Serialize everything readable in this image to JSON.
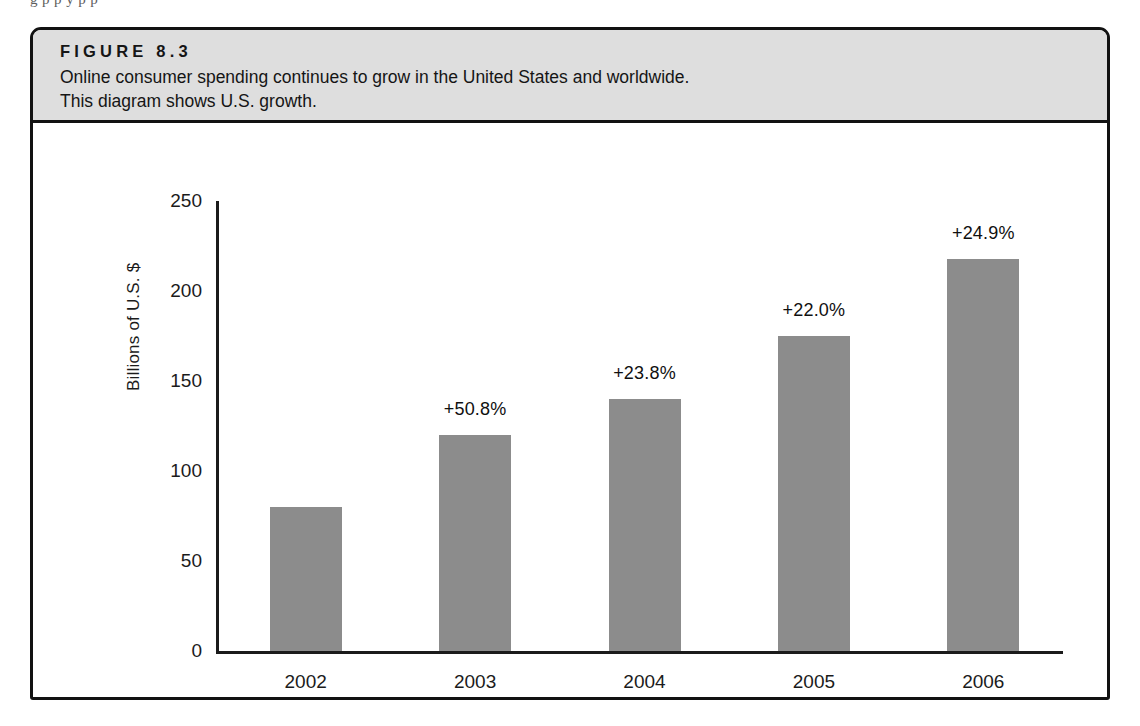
{
  "page": {
    "bleed_text_top": "g                p                    p      y            p                                    p"
  },
  "figure": {
    "label": "FIGURE 8.3",
    "description_line1": "Online consumer spending continues to grow in the United States and worldwide.",
    "description_line2": "This diagram shows U.S. growth.",
    "band_color": "#dedede",
    "border_color": "#121212"
  },
  "chart_data": {
    "type": "bar",
    "title": "",
    "xlabel": "",
    "ylabel": "Billions of U.S. $",
    "categories": [
      "2002",
      "2003",
      "2004",
      "2005",
      "2006"
    ],
    "values": [
      80,
      120,
      140,
      175,
      218
    ],
    "annotations": [
      "",
      "+50.8%",
      "+23.8%",
      "+22.0%",
      "+24.9%"
    ],
    "ylim": [
      0,
      250
    ],
    "yticks": [
      0,
      50,
      100,
      150,
      200,
      250
    ],
    "ytick_labels": [
      "0",
      "50",
      "100",
      "150",
      "200",
      "250"
    ],
    "grid": false,
    "legend": false,
    "bar_color": "#8c8c8c",
    "axis_color": "#1b1b1b"
  }
}
